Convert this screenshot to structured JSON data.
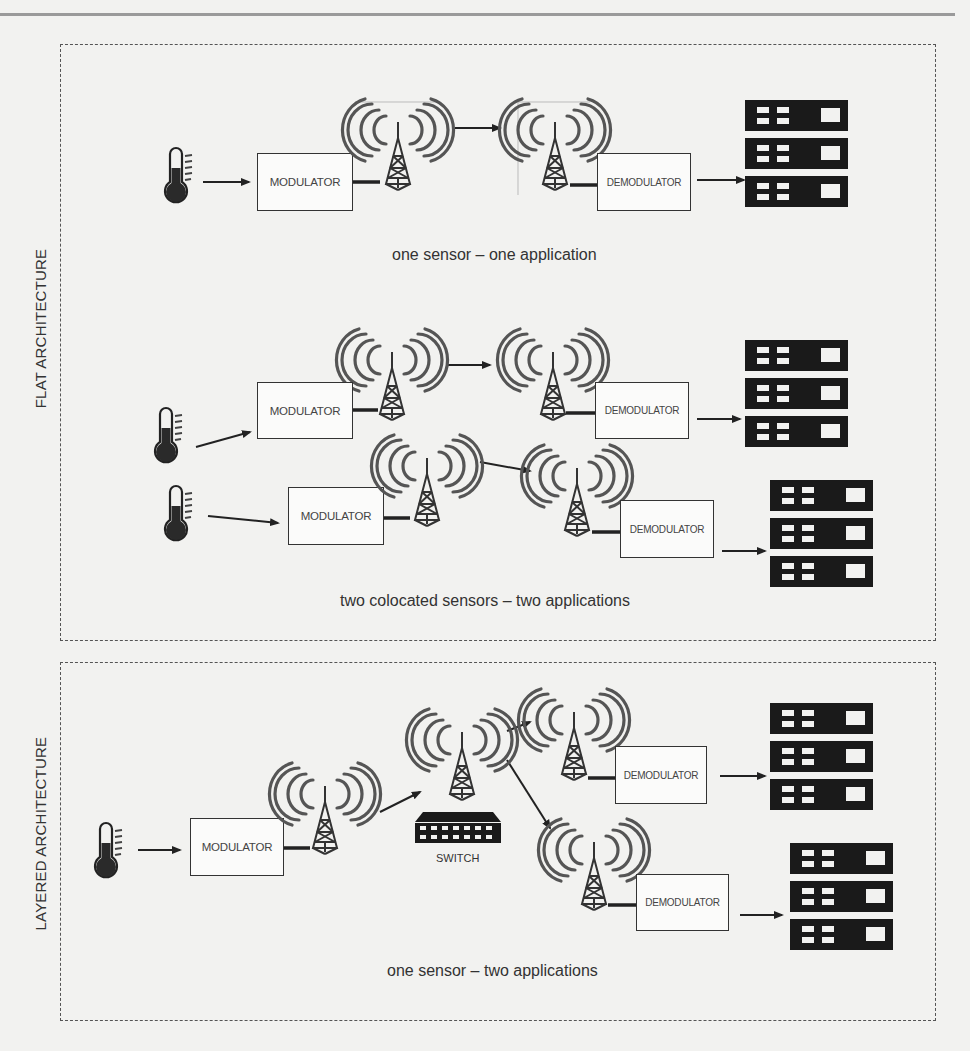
{
  "figure": {
    "sections": [
      {
        "id": "flat",
        "label": "FLAT ARCHITECTURE",
        "scenarios": [
          {
            "caption": "one sensor – one application",
            "modulators": [
              "MODULATOR"
            ],
            "demodulators": [
              "DEMODULATOR"
            ]
          },
          {
            "caption": "two colocated sensors – two applications",
            "modulators": [
              "MODULATOR",
              "MODULATOR"
            ],
            "demodulators": [
              "DEMODULATOR",
              "DEMODULATOR"
            ]
          }
        ]
      },
      {
        "id": "layered",
        "label": "LAYERED ARCHITECTURE",
        "scenarios": [
          {
            "caption": "one sensor – two applications",
            "modulators": [
              "MODULATOR"
            ],
            "switch_label": "SWITCH",
            "demodulators": [
              "DEMODULATOR",
              "DEMODULATOR"
            ]
          }
        ]
      }
    ],
    "icons": {
      "sensor": "thermometer-icon",
      "antenna": "radio-tower-icon",
      "application": "server-rack-icon",
      "switch": "network-switch-icon"
    },
    "colors": {
      "background": "#f2f2f0",
      "stroke": "#333333",
      "server_fill": "#1a1a1a",
      "frame": "#555555"
    }
  }
}
